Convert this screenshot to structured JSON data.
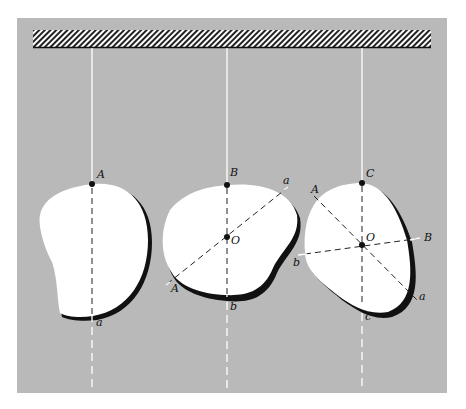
{
  "figure": {
    "panel_color": "#b9b9b9",
    "support_label": "fixed support (hatched)",
    "bodies": [
      {
        "id": "body-1",
        "suspension_point": "A",
        "line_end": "a",
        "labels": [
          "A",
          "a"
        ]
      },
      {
        "id": "body-2",
        "suspension_point": "B",
        "line_end": "b",
        "center": "O",
        "labels": [
          "B",
          "a",
          "O",
          "A",
          "b"
        ]
      },
      {
        "id": "body-3",
        "suspension_point": "C",
        "line_end": "c",
        "center": "O",
        "labels": [
          "C",
          "A",
          "O",
          "B",
          "b",
          "a",
          "c"
        ]
      }
    ]
  }
}
